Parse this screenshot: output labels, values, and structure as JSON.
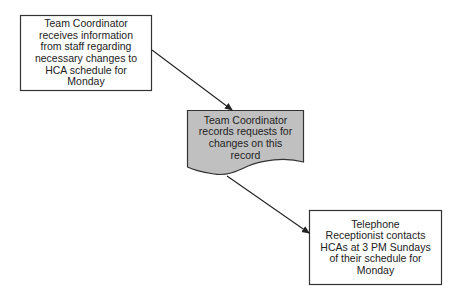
{
  "diagram": {
    "type": "flowchart",
    "nodes": [
      {
        "id": "n1",
        "shape": "process",
        "text": "Team Coordinator\nreceives information\nfrom staff regarding\nnecessary changes to\nHCA schedule for\nMonday",
        "fill": "#ffffff"
      },
      {
        "id": "n2",
        "shape": "document",
        "text": "Team Coordinator\nrecords requests for\nchanges on this\nrecord",
        "fill": "#c0c0c0"
      },
      {
        "id": "n3",
        "shape": "process",
        "text": "Telephone\nReceptionist contacts\nHCAs at 3 PM Sundays\nof their schedule for\nMonday",
        "fill": "#ffffff"
      }
    ],
    "edges": [
      {
        "from": "n1",
        "to": "n2"
      },
      {
        "from": "n2",
        "to": "n3"
      }
    ],
    "colors": {
      "stroke": "#333333",
      "document_fill": "#c0c0c0",
      "box_fill": "#ffffff"
    }
  }
}
